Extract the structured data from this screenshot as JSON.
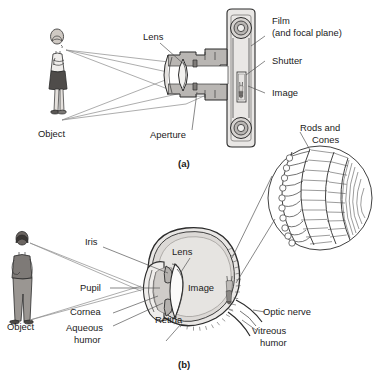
{
  "figure": {
    "panels": [
      {
        "id": "a",
        "caption": "(a)",
        "subject": "camera",
        "labels": {
          "object": "Object",
          "lens": "Lens",
          "aperture": "Aperture",
          "film": "Film",
          "film_sub": "(and focal plane)",
          "shutter": "Shutter",
          "image": "Image"
        }
      },
      {
        "id": "b",
        "caption": "(b)",
        "subject": "human-eye",
        "labels": {
          "object": "Object",
          "iris": "Iris",
          "pupil": "Pupil",
          "cornea": "Cornea",
          "aqueous_1": "Aqueous",
          "aqueous_2": "humor",
          "lens": "Lens",
          "image": "Image",
          "retina": "Retina",
          "optic_nerve": "Optic nerve",
          "vitreous_1": "Vitreous",
          "vitreous_2": "humor",
          "rods_1": "Rods and",
          "rods_2": "Cones"
        }
      }
    ]
  },
  "colors": {
    "background": "#ffffff",
    "ink": "#2b2b2b",
    "label_text": "#1a1a1a",
    "leader_line": "#555555",
    "ray_line": "#8a8a8a",
    "body_fill": "#d8d5d2",
    "shade_fill": "#bdbab7",
    "dark_fill": "#6f6c6a",
    "skin_fill": "#cfc9c3",
    "glass_fill": "#f2f1ef"
  }
}
